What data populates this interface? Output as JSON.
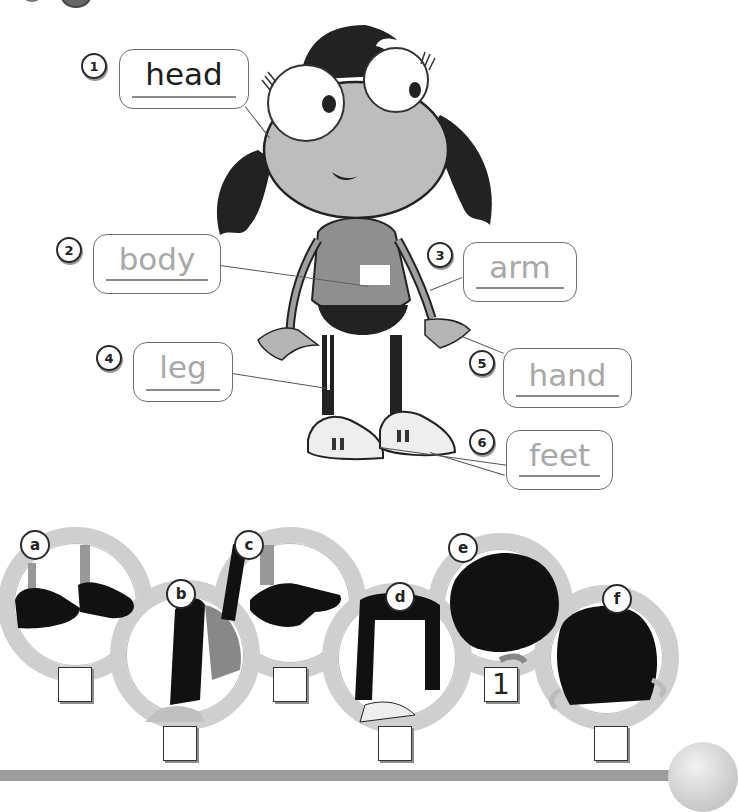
{
  "exercise": {
    "type": "label-the-body-parts",
    "labels": [
      {
        "number": "1",
        "word": "head",
        "state": "written"
      },
      {
        "number": "2",
        "word": "body",
        "state": "trace"
      },
      {
        "number": "3",
        "word": "arm",
        "state": "trace"
      },
      {
        "number": "4",
        "word": "leg",
        "state": "trace"
      },
      {
        "number": "5",
        "word": "hand",
        "state": "trace"
      },
      {
        "number": "6",
        "word": "feet",
        "state": "trace"
      }
    ]
  },
  "matching": {
    "pictures": [
      {
        "letter": "a",
        "depicts": "feet silhouette",
        "answer": ""
      },
      {
        "letter": "b",
        "depicts": "arm silhouette",
        "answer": ""
      },
      {
        "letter": "c",
        "depicts": "hand silhouette",
        "answer": ""
      },
      {
        "letter": "d",
        "depicts": "legs silhouette",
        "answer": ""
      },
      {
        "letter": "e",
        "depicts": "head silhouette",
        "answer": "1"
      },
      {
        "letter": "f",
        "depicts": "body silhouette",
        "answer": ""
      }
    ]
  },
  "colors": {
    "ink": "#1c1c1c",
    "trace": "#a8a8a8",
    "ring": "#cfcfcf",
    "footer": "#9d9d9d"
  }
}
